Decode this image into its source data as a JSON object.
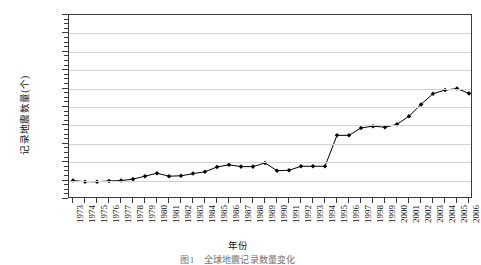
{
  "chart_data": {
    "type": "line",
    "title": "",
    "xlabel": "年份",
    "ylabel": "记录地震数量(个)",
    "xlim": [
      1973,
      2006
    ],
    "ylim": [
      0,
      50000
    ],
    "ytick_step": 5000,
    "grid": true,
    "legend": null,
    "marker": "filled-diamond",
    "line_color": "#000000",
    "grid_color": "#d2d2d2",
    "axis_color": "#3a3a3a",
    "ytick_labels": [
      "0",
      "5 000",
      "10 000",
      "15 000",
      "20 000",
      "25 000",
      "30 000",
      "35 000",
      "40 000",
      "45 000",
      "50 000"
    ],
    "ytick_values": [
      0,
      5000,
      10000,
      15000,
      20000,
      25000,
      30000,
      35000,
      40000,
      45000,
      50000
    ],
    "categories": [
      "1973",
      "1974",
      "1975",
      "1976",
      "1977",
      "1978",
      "1979",
      "1980",
      "1981",
      "1982",
      "1983",
      "1984",
      "1985",
      "1986",
      "1987",
      "1988",
      "1989",
      "1990",
      "1991",
      "1992",
      "1993",
      "1994",
      "1995",
      "1996",
      "1997",
      "1998",
      "1999",
      "2000",
      "2001",
      "2002",
      "2003",
      "2004",
      "2005",
      "2006"
    ],
    "values": [
      5000,
      4700,
      4700,
      4900,
      5000,
      5400,
      6200,
      7000,
      6200,
      6300,
      6900,
      7400,
      8700,
      9300,
      8800,
      8800,
      9800,
      7700,
      7800,
      8900,
      8900,
      8900,
      17300,
      17300,
      19300,
      19800,
      19500,
      20300,
      22500,
      25700,
      28600,
      29600,
      30000,
      28700
    ]
  },
  "figure": {
    "caption": "图1　全球地震记录数量变化"
  }
}
